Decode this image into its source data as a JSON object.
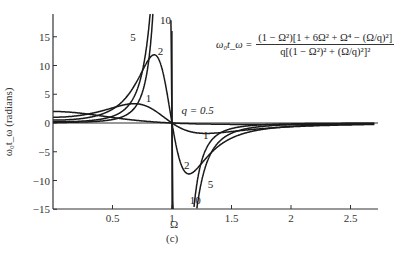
{
  "chart_data": {
    "type": "line",
    "title": "",
    "formula": {
      "lhs": "ω₀t_ω =",
      "numerator": "(1 − Ω²)[1 + 6Ω² + Ω⁴ − (Ω/q)²]",
      "denominator": "q[(1 − Ω²)² + (Ω/q)²]²"
    },
    "xlabel": "Ω",
    "ylabel": "ω₀t_ω (radians)",
    "caption": "(c)",
    "xlim": [
      0,
      2.75
    ],
    "ylim": [
      -15,
      18
    ],
    "x_ticks": [
      "0.5",
      "1",
      "1.5",
      "2",
      "2.5"
    ],
    "x_tick_values": [
      0.5,
      1,
      1.5,
      2,
      2.5
    ],
    "y_ticks": [
      "15",
      "10",
      "5",
      "0",
      "−5",
      "−10",
      "−15"
    ],
    "y_tick_values": [
      15,
      10,
      5,
      0,
      -5,
      -10,
      -15
    ],
    "grid": false,
    "legend": "inline curve labels",
    "series": [
      {
        "name": "q = 0.5",
        "q": 0.5,
        "label": "q = 0.5"
      },
      {
        "name": "q = 1",
        "q": 1,
        "label": "1"
      },
      {
        "name": "q = 2",
        "q": 2,
        "label": "2"
      },
      {
        "name": "q = 5",
        "q": 5,
        "label": "5"
      },
      {
        "name": "q = 10",
        "q": 10,
        "label": "10"
      }
    ],
    "annotations": [
      {
        "text": "q = 0.5",
        "x": 1.08,
        "y": 1.6
      },
      {
        "text": "1",
        "x": 0.78,
        "y": 3.6
      },
      {
        "text": "1",
        "x": 1.26,
        "y": -2.8
      },
      {
        "text": "2",
        "x": 0.88,
        "y": 11.8
      },
      {
        "text": "2",
        "x": 1.1,
        "y": -8.0
      },
      {
        "text": "5",
        "x": 0.65,
        "y": 14.2
      },
      {
        "text": "5",
        "x": 1.3,
        "y": -11.3
      },
      {
        "text": "10",
        "x": 0.9,
        "y": 17.2
      },
      {
        "text": "10",
        "x": 1.15,
        "y": -14.0
      }
    ]
  }
}
